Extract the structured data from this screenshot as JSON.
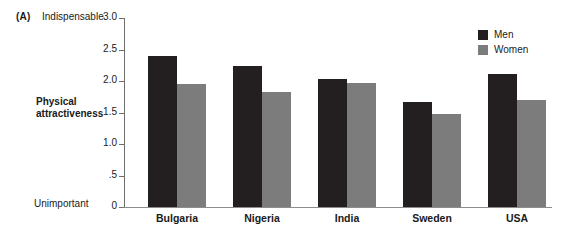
{
  "panel": {
    "letter": "(A)"
  },
  "scale": {
    "top_anchor": "Indispensable",
    "bottom_anchor": "Unimportant"
  },
  "colors": {
    "men": "#231f20",
    "women": "#7c7c7c",
    "axis": "#6e6e6e",
    "background": "#ffffff"
  },
  "legend": {
    "position": "top-right",
    "entries": [
      {
        "label": "Men",
        "color": "#231f20"
      },
      {
        "label": "Women",
        "color": "#7c7c7c"
      }
    ]
  },
  "chart_data": {
    "type": "bar",
    "title": "",
    "subtitle": "",
    "xlabel": "",
    "ylabel": "Physical attractiveness",
    "categories": [
      "Bulgaria",
      "Nigeria",
      "India",
      "Sweden",
      "USA"
    ],
    "series": [
      {
        "name": "Men",
        "values": [
          2.4,
          2.24,
          2.03,
          1.67,
          2.11
        ]
      },
      {
        "name": "Women",
        "values": [
          1.95,
          1.83,
          1.97,
          1.48,
          1.7
        ]
      }
    ],
    "ylim": [
      0,
      3.0
    ],
    "yticks": [
      0,
      0.5,
      1.0,
      1.5,
      2.0,
      2.5,
      3.0
    ],
    "ytick_labels": [
      "0",
      ".5",
      "1.0",
      "1.5",
      "2.0",
      "2.5",
      "3.0"
    ],
    "grid": false,
    "legend_position": "top-right",
    "annotations": [
      {
        "text": "Indispensable",
        "at": "y-axis-top"
      },
      {
        "text": "Unimportant",
        "at": "y-axis-bottom"
      },
      {
        "text": "(A)",
        "at": "panel-letter"
      }
    ]
  }
}
